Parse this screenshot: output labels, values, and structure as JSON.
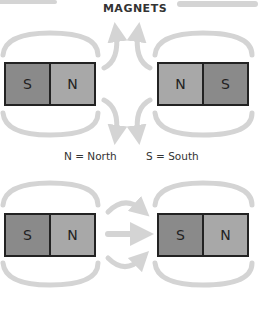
{
  "title": "MAGNETS",
  "legend": {
    "north": "N = North",
    "south": "S = South"
  },
  "magnets": [
    {
      "id": "top-left",
      "left": "S",
      "right": "N"
    },
    {
      "id": "top-right",
      "left": "N",
      "right": "S"
    },
    {
      "id": "bottom-left",
      "left": "S",
      "right": "N"
    },
    {
      "id": "bottom-right",
      "left": "S",
      "right": "N"
    }
  ],
  "colors": {
    "south": "#8a8a8a",
    "north": "#a8a8a8",
    "field_arrow": "#d4d4d4",
    "border": "#222222"
  }
}
